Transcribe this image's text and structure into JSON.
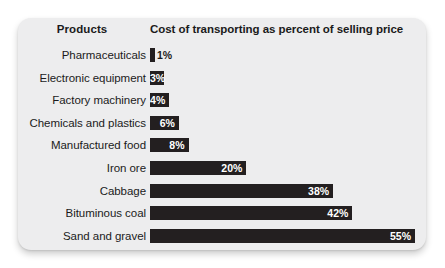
{
  "card": {
    "background_color": "#ededee",
    "bar_color": "#231f20",
    "text_color": "#1b1b1b"
  },
  "header": {
    "products_label": "Products",
    "cost_label": "Cost of transporting as percent of selling price"
  },
  "chart_data": {
    "type": "bar",
    "orientation": "horizontal",
    "title": "Cost of transporting as percent of selling price",
    "xlabel": "Cost of transporting as percent of selling price",
    "ylabel": "Products",
    "xlim": [
      0,
      55
    ],
    "grid": false,
    "legend": null,
    "categories": [
      "Pharmaceuticals",
      "Electronic equipment",
      "Factory machinery",
      "Chemicals and plastics",
      "Manufactured food",
      "Iron ore",
      "Cabbage",
      "Bituminous coal",
      "Sand and gravel"
    ],
    "values": [
      1,
      3,
      4,
      6,
      8,
      20,
      38,
      42,
      55
    ],
    "value_labels": [
      "1%",
      "3%",
      "4%",
      "6%",
      "8%",
      "20%",
      "38%",
      "42%",
      "55%"
    ],
    "label_placement": [
      "outside",
      "inside",
      "inside",
      "inside",
      "inside",
      "inside",
      "inside",
      "inside",
      "inside"
    ]
  },
  "rows": [
    {
      "label": "Pharmaceuticals",
      "value": 1,
      "value_label": "1%",
      "placement": "outside"
    },
    {
      "label": "Electronic equipment",
      "value": 3,
      "value_label": "3%",
      "placement": "inside"
    },
    {
      "label": "Factory machinery",
      "value": 4,
      "value_label": "4%",
      "placement": "inside"
    },
    {
      "label": "Chemicals and plastics",
      "value": 6,
      "value_label": "6%",
      "placement": "inside"
    },
    {
      "label": "Manufactured food",
      "value": 8,
      "value_label": "8%",
      "placement": "inside"
    },
    {
      "label": "Iron ore",
      "value": 20,
      "value_label": "20%",
      "placement": "inside"
    },
    {
      "label": "Cabbage",
      "value": 38,
      "value_label": "38%",
      "placement": "inside"
    },
    {
      "label": "Bituminous coal",
      "value": 42,
      "value_label": "42%",
      "placement": "inside"
    },
    {
      "label": "Sand and gravel",
      "value": 55,
      "value_label": "55%",
      "placement": "inside"
    }
  ]
}
